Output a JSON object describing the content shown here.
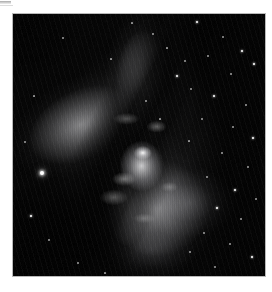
{
  "page": {
    "background_color": "#ffffff",
    "width": 272,
    "height": 292
  },
  "artifact": {
    "name": "cropped-rule-fragment",
    "color": "#9a9a9a",
    "note": ""
  },
  "photo": {
    "name": "bipolar-nebula-photograph",
    "alt_text": "Grayscale astronomical photograph of a bipolar reflection nebula",
    "frame": {
      "left": 12,
      "top": 13,
      "width": 254,
      "height": 264,
      "border_color": "#b9b9b9"
    },
    "background_color": "#030303",
    "nebula_color": "#dcdcdf",
    "core_color": "#ffffff",
    "dust_lane_color": "#000000",
    "caption": "",
    "features": [
      {
        "name": "upper-lobe",
        "label": ""
      },
      {
        "name": "lower-lobe",
        "label": ""
      },
      {
        "name": "central-waist",
        "label": ""
      },
      {
        "name": "dust-lane",
        "label": ""
      },
      {
        "name": "star-field",
        "label": ""
      }
    ]
  },
  "stars": [
    {
      "x": 41,
      "y": 172,
      "r": 2.4,
      "class": "star-bright"
    },
    {
      "x": 196,
      "y": 21,
      "r": 1.2,
      "class": "star-med"
    },
    {
      "x": 222,
      "y": 36,
      "r": 0.8,
      "class": "star-dim"
    },
    {
      "x": 241,
      "y": 50,
      "r": 1.0,
      "class": "star-med"
    },
    {
      "x": 207,
      "y": 55,
      "r": 0.7,
      "class": "star-dim"
    },
    {
      "x": 253,
      "y": 63,
      "r": 0.9,
      "class": "star-med"
    },
    {
      "x": 230,
      "y": 73,
      "r": 0.7,
      "class": "star-dim"
    },
    {
      "x": 184,
      "y": 60,
      "r": 0.8,
      "class": "star-dim"
    },
    {
      "x": 152,
      "y": 33,
      "r": 0.7,
      "class": "star-dim"
    },
    {
      "x": 166,
      "y": 47,
      "r": 0.6,
      "class": "star-dim"
    },
    {
      "x": 176,
      "y": 75,
      "r": 1.0,
      "class": "star-med"
    },
    {
      "x": 190,
      "y": 88,
      "r": 0.7,
      "class": "star-dim"
    },
    {
      "x": 213,
      "y": 95,
      "r": 1.1,
      "class": "star-med"
    },
    {
      "x": 245,
      "y": 104,
      "r": 0.7,
      "class": "star-dim"
    },
    {
      "x": 201,
      "y": 118,
      "r": 0.8,
      "class": "star-dim"
    },
    {
      "x": 232,
      "y": 126,
      "r": 0.7,
      "class": "star-dim"
    },
    {
      "x": 252,
      "y": 137,
      "r": 0.9,
      "class": "star-med"
    },
    {
      "x": 188,
      "y": 140,
      "r": 0.6,
      "class": "star-dim"
    },
    {
      "x": 221,
      "y": 152,
      "r": 0.7,
      "class": "star-dim"
    },
    {
      "x": 247,
      "y": 166,
      "r": 0.8,
      "class": "star-dim"
    },
    {
      "x": 206,
      "y": 176,
      "r": 0.7,
      "class": "star-dim"
    },
    {
      "x": 234,
      "y": 189,
      "r": 1.0,
      "class": "star-med"
    },
    {
      "x": 255,
      "y": 198,
      "r": 0.8,
      "class": "star-dim"
    },
    {
      "x": 216,
      "y": 207,
      "r": 0.9,
      "class": "star-med"
    },
    {
      "x": 240,
      "y": 218,
      "r": 0.7,
      "class": "star-dim"
    },
    {
      "x": 203,
      "y": 232,
      "r": 0.8,
      "class": "star-dim"
    },
    {
      "x": 229,
      "y": 243,
      "r": 0.7,
      "class": "star-dim"
    },
    {
      "x": 251,
      "y": 256,
      "r": 1.2,
      "class": "star-med"
    },
    {
      "x": 189,
      "y": 251,
      "r": 0.7,
      "class": "star-dim"
    },
    {
      "x": 214,
      "y": 266,
      "r": 0.8,
      "class": "star-dim"
    },
    {
      "x": 62,
      "y": 37,
      "r": 0.7,
      "class": "star-dim"
    },
    {
      "x": 33,
      "y": 95,
      "r": 0.6,
      "class": "star-dim"
    },
    {
      "x": 24,
      "y": 141,
      "r": 0.7,
      "class": "star-dim"
    },
    {
      "x": 30,
      "y": 215,
      "r": 0.9,
      "class": "star-med"
    },
    {
      "x": 48,
      "y": 239,
      "r": 0.7,
      "class": "star-dim"
    },
    {
      "x": 77,
      "y": 262,
      "r": 0.8,
      "class": "star-dim"
    },
    {
      "x": 104,
      "y": 272,
      "r": 0.6,
      "class": "star-dim"
    },
    {
      "x": 131,
      "y": 22,
      "r": 0.6,
      "class": "star-dim"
    },
    {
      "x": 110,
      "y": 58,
      "r": 0.6,
      "class": "star-dim"
    },
    {
      "x": 145,
      "y": 100,
      "r": 0.7,
      "class": "star-dim"
    },
    {
      "x": 159,
      "y": 118,
      "r": 0.6,
      "class": "star-dim"
    }
  ]
}
